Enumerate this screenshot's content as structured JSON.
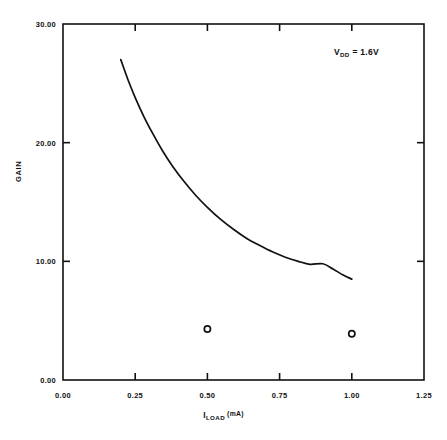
{
  "chart_data": {
    "type": "line",
    "title": "",
    "xlabel": "I_LOAD (mA)",
    "ylabel": "GAIN",
    "xlim": [
      0.0,
      1.25
    ],
    "ylim": [
      0.0,
      30.0
    ],
    "grid": false,
    "legend": "none",
    "xticks": [
      0.0,
      0.25,
      0.5,
      0.75,
      1.0,
      1.25
    ],
    "xtick_labels": [
      "0.00",
      "0.25",
      "0.50",
      "0.75",
      "1.00",
      "1.25"
    ],
    "yticks": [
      0.0,
      10.0,
      20.0,
      30.0
    ],
    "ytick_labels": [
      "0.00",
      "10.00",
      "20.00",
      "30.00"
    ],
    "series": [
      {
        "name": "gain-curve",
        "type": "line",
        "x": [
          0.2,
          0.225,
          0.25,
          0.28,
          0.31,
          0.345,
          0.38,
          0.42,
          0.46,
          0.5,
          0.545,
          0.59,
          0.635,
          0.68,
          0.725,
          0.77,
          0.815,
          0.855,
          0.9,
          0.935,
          0.97,
          1.0
        ],
        "y": [
          27.0,
          25.3,
          23.8,
          22.2,
          20.8,
          19.3,
          18.0,
          16.7,
          15.55,
          14.55,
          13.55,
          12.7,
          11.95,
          11.35,
          10.8,
          10.35,
          10.0,
          9.75,
          9.8,
          9.35,
          8.85,
          8.5
        ]
      },
      {
        "name": "measured-points",
        "type": "scatter",
        "x": [
          0.5,
          1.0
        ],
        "y": [
          4.3,
          3.9
        ]
      }
    ],
    "annotations": [
      {
        "name": "supply-voltage",
        "prefix": "V",
        "subscript": "DD",
        "suffix": " = 1.6V",
        "x": 1.05,
        "y": 28.0
      }
    ]
  },
  "axis": {
    "y_title": "GAIN",
    "x_title_main": "I",
    "x_title_sub": "LOAD",
    "x_title_unit": "(mA)"
  },
  "style": {
    "line_color": "#111111",
    "marker_color": "#111111",
    "axis_color": "#111111",
    "background": "#ffffff"
  }
}
